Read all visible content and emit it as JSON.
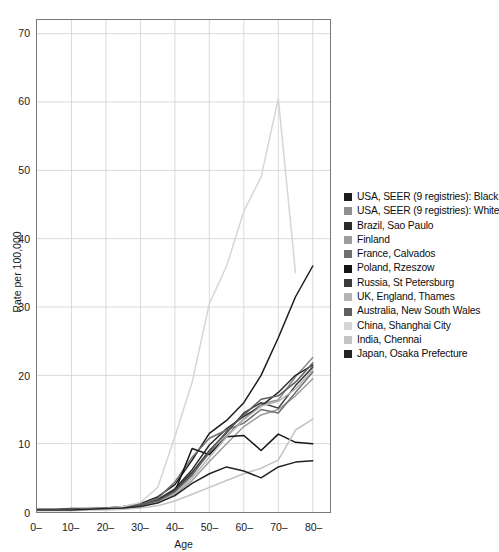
{
  "chart_data": {
    "type": "line",
    "title": "",
    "xlabel": "Age",
    "ylabel": "Rate per 100,000",
    "xlim": [
      0,
      85
    ],
    "ylim": [
      0,
      72
    ],
    "yticks": [
      0,
      10,
      20,
      30,
      40,
      50,
      60,
      70
    ],
    "ytick_labels": [
      "0",
      "10",
      "20",
      "30",
      "40",
      "50",
      "60",
      "70"
    ],
    "xticks": [
      0,
      10,
      20,
      30,
      40,
      50,
      60,
      70,
      80
    ],
    "xtick_labels": [
      "0–",
      "10–",
      "20–",
      "30–",
      "40–",
      "50–",
      "60–",
      "70–",
      "80–"
    ],
    "grid": true,
    "legend_position": "right",
    "x": [
      0,
      5,
      10,
      15,
      20,
      25,
      30,
      35,
      40,
      45,
      50,
      55,
      60,
      65,
      70,
      75,
      80
    ],
    "series": [
      {
        "name": "USA, SEER (9 registries): Black",
        "color": "#1c1c1c",
        "values": [
          0.4,
          0.4,
          0.5,
          0.5,
          0.6,
          0.8,
          1.2,
          2.2,
          4.0,
          7.6,
          11.5,
          13.4,
          16.0,
          20.0,
          25.5,
          31.5,
          36.0
        ]
      },
      {
        "name": "USA, SEER (9 registries): White",
        "color": "#8f8f8f",
        "values": [
          0.4,
          0.4,
          0.4,
          0.5,
          0.6,
          0.7,
          1.0,
          1.6,
          3.2,
          5.6,
          8.6,
          11.2,
          13.6,
          15.8,
          16.4,
          19.8,
          22.6
        ]
      },
      {
        "name": "Brazil, Sao Paulo",
        "color": "#2b2b2b",
        "values": [
          0.3,
          0.3,
          0.4,
          0.4,
          0.5,
          0.7,
          1.0,
          1.8,
          3.4,
          6.2,
          9.8,
          12.2,
          14.0,
          15.5,
          17.5,
          20.0,
          21.5
        ]
      },
      {
        "name": "Finland",
        "color": "#9c9c9c",
        "values": [
          0.3,
          0.3,
          0.3,
          0.4,
          0.5,
          0.6,
          0.9,
          1.4,
          2.6,
          4.6,
          7.4,
          10.0,
          12.5,
          14.2,
          15.0,
          17.0,
          19.5
        ]
      },
      {
        "name": "France, Calvados",
        "color": "#707070",
        "values": [
          0.3,
          0.3,
          0.4,
          0.4,
          0.5,
          0.7,
          1.1,
          2.0,
          4.4,
          8.0,
          10.8,
          12.0,
          13.0,
          15.0,
          14.5,
          17.5,
          20.5
        ]
      },
      {
        "name": "Poland, Rzeszow",
        "color": "#141414",
        "values": [
          0.3,
          0.3,
          0.3,
          0.4,
          0.5,
          0.6,
          0.9,
          1.5,
          3.0,
          9.3,
          8.4,
          11.0,
          11.2,
          9.0,
          11.4,
          10.2,
          10.0
        ]
      },
      {
        "name": "Russia, St Petersburg",
        "color": "#3a3a3a",
        "values": [
          0.3,
          0.3,
          0.4,
          0.4,
          0.5,
          0.7,
          1.0,
          1.7,
          3.2,
          5.8,
          9.0,
          11.6,
          14.5,
          16.0,
          15.2,
          18.5,
          21.2
        ]
      },
      {
        "name": "UK, England, Thames",
        "color": "#b3b3b3",
        "values": [
          0.3,
          0.3,
          0.3,
          0.4,
          0.5,
          0.6,
          0.9,
          1.5,
          2.8,
          5.0,
          8.0,
          11.0,
          13.5,
          15.5,
          16.2,
          18.0,
          20.8
        ]
      },
      {
        "name": "Australia, New South Wales",
        "color": "#5e5e5e",
        "values": [
          0.3,
          0.3,
          0.4,
          0.4,
          0.5,
          0.7,
          1.0,
          1.6,
          3.0,
          5.4,
          8.8,
          11.8,
          14.2,
          16.5,
          17.0,
          19.0,
          21.8
        ]
      },
      {
        "name": "China, Shanghai City",
        "color": "#d6d6d6",
        "values": [
          0.3,
          0.3,
          0.3,
          0.4,
          0.5,
          0.8,
          1.4,
          3.6,
          11.0,
          19.0,
          30.5,
          36.0,
          44.0,
          49.0,
          60.5,
          35.0,
          null
        ]
      },
      {
        "name": "India, Chennai",
        "color": "#c4c4c4",
        "values": [
          0.2,
          0.2,
          0.2,
          0.3,
          0.3,
          0.4,
          0.6,
          0.9,
          1.6,
          2.6,
          3.6,
          4.6,
          5.6,
          6.4,
          7.6,
          12.0,
          13.6
        ]
      },
      {
        "name": "Japan, Osaka Prefecture",
        "color": "#232323",
        "values": [
          0.3,
          0.3,
          0.3,
          0.4,
          0.5,
          0.6,
          0.8,
          1.3,
          2.4,
          4.2,
          5.6,
          6.6,
          6.0,
          5.0,
          6.6,
          7.3,
          7.5
        ]
      }
    ]
  },
  "legend": {
    "items": [
      {
        "label": "USA, SEER (9 registries): Black",
        "color": "#1c1c1c"
      },
      {
        "label": "USA, SEER (9 registries): White",
        "color": "#8f8f8f"
      },
      {
        "label": "Brazil, Sao Paulo",
        "color": "#2b2b2b"
      },
      {
        "label": "Finland",
        "color": "#9c9c9c"
      },
      {
        "label": "France, Calvados",
        "color": "#707070"
      },
      {
        "label": "Poland, Rzeszow",
        "color": "#141414"
      },
      {
        "label": "Russia, St Petersburg",
        "color": "#3a3a3a"
      },
      {
        "label": "UK, England, Thames",
        "color": "#b3b3b3"
      },
      {
        "label": "Australia, New South Wales",
        "color": "#5e5e5e"
      },
      {
        "label": "China, Shanghai City",
        "color": "#d6d6d6"
      },
      {
        "label": "India, Chennai",
        "color": "#c4c4c4"
      },
      {
        "label": "Japan, Osaka Prefecture",
        "color": "#232323"
      }
    ]
  }
}
